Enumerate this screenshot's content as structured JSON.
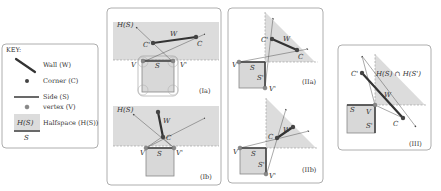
{
  "key": {
    "title": "KEY:",
    "items": [
      {
        "icon": "wall-line-icon",
        "label": "Wall (W)"
      },
      {
        "icon": "corner-dot-icon",
        "label": "Corner (C)"
      },
      {
        "icon": "side-line-icon",
        "label": "Side (S)"
      },
      {
        "icon": "vertex-dot-icon",
        "label": "vertex (V)"
      },
      {
        "icon": "halfspace-icon",
        "label": "Halfspace (H(S))",
        "icon_top": "H(S)",
        "icon_bottom": "S"
      }
    ]
  },
  "panels": {
    "Ia": {
      "tag": "(Ia)",
      "labels": {
        "H": "H(S)",
        "W": "W",
        "C": "C",
        "Cp": "C'",
        "S": "S",
        "V": "V",
        "Vp": "V'"
      }
    },
    "Ib": {
      "tag": "(Ib)",
      "labels": {
        "H": "H(S)",
        "W": "W",
        "C": "C",
        "S": "S",
        "V": "V",
        "Vp": "V'"
      }
    },
    "IIa": {
      "tag": "(IIa)",
      "labels": {
        "W": "W",
        "C": "C",
        "Cp": "C'",
        "S": "S",
        "Sp": "S'",
        "V": "V",
        "Vp": "V'"
      }
    },
    "IIb": {
      "tag": "(IIb)",
      "labels": {
        "W": "W",
        "C": "C",
        "S": "S",
        "Sp": "S'",
        "V": "V",
        "Vp": "V'"
      }
    },
    "III": {
      "tag": "(III)",
      "labels": {
        "H": "H(S) ∩ H(S')",
        "W": "W",
        "C": "C",
        "Cp": "C'",
        "S": "S",
        "Sp": "S'",
        "V": "V"
      }
    }
  }
}
